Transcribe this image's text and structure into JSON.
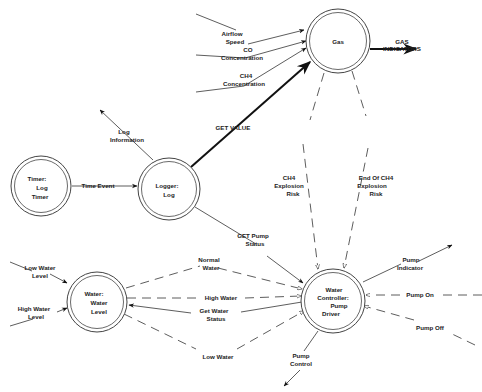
{
  "diagram": {
    "type": "data-flow-diagram",
    "processes": [
      {
        "id": "gas",
        "lines": [
          "Gas"
        ]
      },
      {
        "id": "logger",
        "lines": [
          "Logger:",
          "Log"
        ]
      },
      {
        "id": "timer",
        "lines": [
          "Timer:",
          "Log",
          "Timer"
        ]
      },
      {
        "id": "water",
        "lines": [
          "Water:",
          "Water",
          "Level"
        ]
      },
      {
        "id": "controller",
        "lines": [
          "Water",
          "Controller:",
          "Pump",
          "Driver"
        ]
      }
    ],
    "flows": [
      {
        "id": "airflow-speed",
        "lines": [
          "Airflow",
          "Speed"
        ],
        "from": "external",
        "to": "gas",
        "style": "solid"
      },
      {
        "id": "co-concentration",
        "lines": [
          "CO",
          "Concentration"
        ],
        "from": "external",
        "to": "gas",
        "style": "solid"
      },
      {
        "id": "ch4-concentration",
        "lines": [
          "CH4",
          "Concentration"
        ],
        "from": "external",
        "to": "gas",
        "style": "solid"
      },
      {
        "id": "gas-indicators",
        "lines": [
          "GAS",
          "INDICATORS"
        ],
        "from": "gas",
        "to": "external",
        "style": "bold"
      },
      {
        "id": "get-value",
        "lines": [
          "GET VALUE"
        ],
        "from": "logger",
        "to": "gas",
        "style": "bold"
      },
      {
        "id": "log-information",
        "lines": [
          "Log",
          "Information"
        ],
        "from": "logger",
        "to": "external",
        "style": "solid"
      },
      {
        "id": "time-event",
        "lines": [
          "Time Event"
        ],
        "from": "timer",
        "to": "logger",
        "style": "solid"
      },
      {
        "id": "ch4-explosion-risk",
        "lines": [
          "CH4",
          "Explosion",
          "Risk"
        ],
        "from": "gas",
        "to": "controller",
        "style": "dashed"
      },
      {
        "id": "end-ch4-explosion-risk",
        "lines": [
          "End Of CH4",
          "Explosion",
          "Risk"
        ],
        "from": "gas",
        "to": "controller",
        "style": "dashed"
      },
      {
        "id": "get-pump-status",
        "lines": [
          "GET Pump",
          "Status"
        ],
        "from": "logger",
        "to": "controller",
        "style": "solid"
      },
      {
        "id": "low-water-level",
        "lines": [
          "Low Water",
          "Level"
        ],
        "from": "external",
        "to": "water",
        "style": "solid"
      },
      {
        "id": "high-water-level",
        "lines": [
          "High Water",
          "Level"
        ],
        "from": "external",
        "to": "water",
        "style": "solid"
      },
      {
        "id": "normal-water",
        "lines": [
          "Normal",
          "Water"
        ],
        "from": "water",
        "to": "controller",
        "style": "dashed"
      },
      {
        "id": "high-water",
        "lines": [
          "High Water"
        ],
        "from": "water",
        "to": "controller",
        "style": "dashed"
      },
      {
        "id": "get-water-status",
        "lines": [
          "Get Water",
          "Status"
        ],
        "from": "controller",
        "to": "water",
        "style": "solid"
      },
      {
        "id": "low-water",
        "lines": [
          "Low Water"
        ],
        "from": "water",
        "to": "controller",
        "style": "dashed"
      },
      {
        "id": "pump-indicator",
        "lines": [
          "Pump",
          "Indicator"
        ],
        "from": "controller",
        "to": "external",
        "style": "solid"
      },
      {
        "id": "pump-on",
        "lines": [
          "Pump On"
        ],
        "from": "external",
        "to": "controller",
        "style": "dashed"
      },
      {
        "id": "pump-off",
        "lines": [
          "Pump Off"
        ],
        "from": "external",
        "to": "controller",
        "style": "dashed"
      },
      {
        "id": "pump-control",
        "lines": [
          "Pump",
          "Control"
        ],
        "from": "controller",
        "to": "external",
        "style": "solid"
      }
    ]
  }
}
